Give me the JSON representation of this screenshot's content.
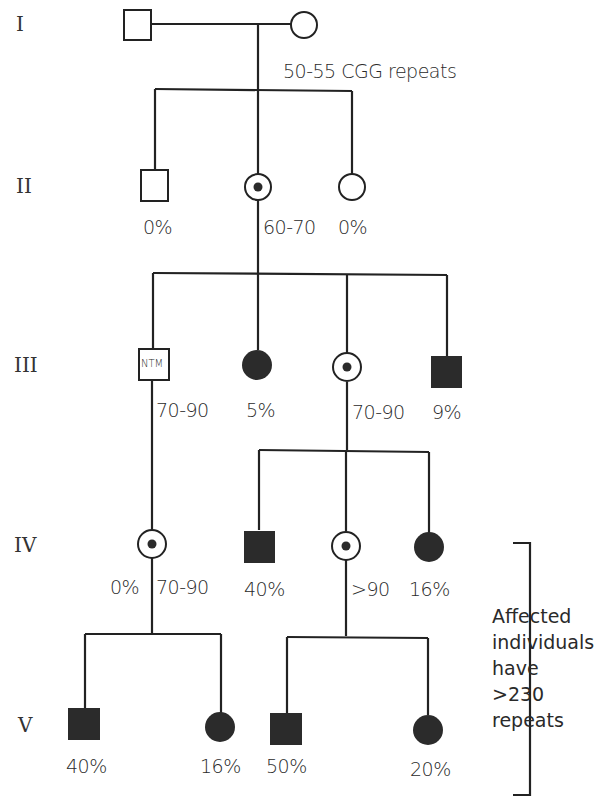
{
  "generations": [
    "I",
    "II",
    "III",
    "IV",
    "V"
  ],
  "labels": {
    "gen1_repeats": "50-55 CGG repeats",
    "g2_male": "0%",
    "g2_carrier": "60-70",
    "g2_female": "0%",
    "g3_ntm": "70-90",
    "g3_aff_female": "5%",
    "g3_carrier": "70-90",
    "g3_aff_male": "9%",
    "g4_carrier1_pct": "0%",
    "g4_carrier1_rep": "70-90",
    "g4_aff_male": "40%",
    "g4_carrier2_rep": ">90",
    "g4_aff_female": "16%",
    "g5_m1": "40%",
    "g5_f1": "16%",
    "g5_m2": "50%",
    "g5_f2": "20%"
  },
  "ntm_text": "NTM",
  "note": "Affected\nindividuals\nhave\n>230\nrepeats",
  "colors": {
    "line": "#222222",
    "fill": "#2b2b2b"
  }
}
